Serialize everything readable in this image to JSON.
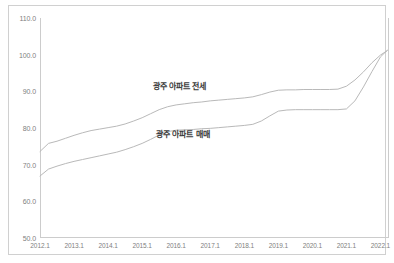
{
  "chart_data": {
    "type": "line",
    "title": "",
    "subtitle": "",
    "xlabel": "",
    "ylabel": "",
    "grid": false,
    "legend_position": "inline-annotation",
    "xlim": [
      2012.0,
      2022.25
    ],
    "ylim": [
      50.0,
      110.0
    ],
    "y_ticks": [
      "50.0",
      "60.0",
      "70.0",
      "80.0",
      "90.0",
      "100.0",
      "110.0"
    ],
    "y_tick_values": [
      50,
      60,
      70,
      80,
      90,
      100,
      110
    ],
    "x_ticks": [
      "2012.1",
      "2013.1",
      "2014.1",
      "2015.1",
      "2016.1",
      "2017.1",
      "2018.1",
      "2019.1",
      "2020.1",
      "2021.1",
      "2022.1"
    ],
    "x_tick_values": [
      2012,
      2013,
      2014,
      2015,
      2016,
      2017,
      2018,
      2019,
      2020,
      2021,
      2022
    ],
    "series": [
      {
        "name": "광주 아파트 전세",
        "color": "#b9b9b9",
        "label_x": 2016.1,
        "label_y": 91.7,
        "x": [
          2012.0,
          2012.25,
          2012.5,
          2012.75,
          2013.0,
          2013.25,
          2013.5,
          2013.75,
          2014.0,
          2014.25,
          2014.5,
          2014.75,
          2015.0,
          2015.25,
          2015.5,
          2015.75,
          2016.0,
          2016.25,
          2016.5,
          2016.75,
          2017.0,
          2017.25,
          2017.5,
          2017.75,
          2018.0,
          2018.25,
          2018.5,
          2018.75,
          2019.0,
          2019.25,
          2019.5,
          2019.75,
          2020.0,
          2020.25,
          2020.5,
          2020.75,
          2021.0,
          2021.25,
          2021.5,
          2021.75,
          2022.0,
          2022.2
        ],
        "y": [
          73.6,
          75.8,
          76.4,
          77.2,
          78.0,
          78.7,
          79.3,
          79.7,
          80.1,
          80.5,
          81.1,
          81.9,
          82.8,
          83.9,
          85.0,
          85.8,
          86.3,
          86.6,
          86.9,
          87.1,
          87.4,
          87.6,
          87.8,
          88.0,
          88.2,
          88.5,
          89.1,
          89.8,
          90.3,
          90.4,
          90.4,
          90.5,
          90.5,
          90.5,
          90.5,
          90.6,
          91.4,
          93.1,
          95.3,
          97.8,
          99.9,
          101.1
        ]
      },
      {
        "name": "광주 아파트 매매",
        "color": "#b9b9b9",
        "label_x": 2016.2,
        "label_y": 78.6,
        "x": [
          2012.0,
          2012.25,
          2012.5,
          2012.75,
          2013.0,
          2013.25,
          2013.5,
          2013.75,
          2014.0,
          2014.25,
          2014.5,
          2014.75,
          2015.0,
          2015.25,
          2015.5,
          2015.75,
          2016.0,
          2016.25,
          2016.5,
          2016.75,
          2017.0,
          2017.25,
          2017.5,
          2017.75,
          2018.0,
          2018.25,
          2018.5,
          2018.75,
          2019.0,
          2019.25,
          2019.5,
          2019.75,
          2020.0,
          2020.25,
          2020.5,
          2020.75,
          2021.0,
          2021.25,
          2021.5,
          2021.75,
          2022.0,
          2022.2
        ],
        "y": [
          66.9,
          68.8,
          69.6,
          70.3,
          70.9,
          71.4,
          71.9,
          72.4,
          72.9,
          73.4,
          74.1,
          74.9,
          75.8,
          76.9,
          78.1,
          79.0,
          79.4,
          79.5,
          79.6,
          79.8,
          79.9,
          80.1,
          80.3,
          80.5,
          80.7,
          81.0,
          81.9,
          83.3,
          84.6,
          84.9,
          85.0,
          85.0,
          85.0,
          85.0,
          85.0,
          85.0,
          85.2,
          87.4,
          91.2,
          95.4,
          99.4,
          101.2
        ]
      }
    ]
  }
}
